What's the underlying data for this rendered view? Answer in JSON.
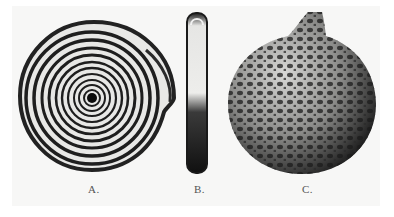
{
  "figure": {
    "panels": [
      {
        "label": "A.",
        "subject": "coiled-spiral-shell-face-view"
      },
      {
        "label": "B.",
        "subject": "shell-edge-view"
      },
      {
        "label": "C.",
        "subject": "reticulated-spherical-specimen"
      }
    ],
    "colors": {
      "background": "#f7f7f6",
      "ink": "#1c1c1c",
      "paper": "#ffffff"
    }
  }
}
